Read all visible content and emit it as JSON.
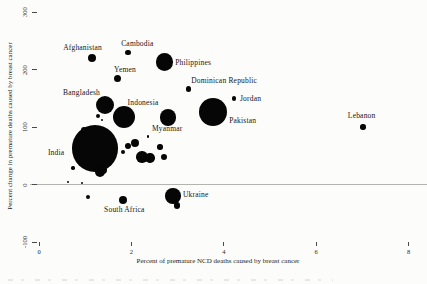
{
  "figure": {
    "background": "#fcfcfa",
    "bubble_color": "#060606",
    "text_color": "#1a1a1a",
    "zero_line_color": "#b5b3ae"
  },
  "chart_data": {
    "type": "scatter",
    "title": "",
    "xlabel": "Percent of premature NCD deaths caused by breast cancer",
    "ylabel": "Percent change in premature deaths caused by breast cancer",
    "xlim": [
      0,
      8.4
    ],
    "ylim": [
      -130,
      310
    ],
    "x_ticks": [
      0,
      2,
      4,
      6,
      8
    ],
    "y_ticks": [
      300,
      200,
      100,
      0,
      -100
    ],
    "grid": false,
    "zero_reference_line": true,
    "legend": "none",
    "series": [
      {
        "name": "countries",
        "points": [
          {
            "name": "Afghanistan",
            "x": 1.15,
            "y": 220,
            "r": 4.0,
            "label_offset": [
              -29,
              -14
            ]
          },
          {
            "name": "Cambodia",
            "x": 1.93,
            "y": 230,
            "r": 2.7,
            "label_offset": [
              -7,
              -12
            ]
          },
          {
            "name": "Philippines",
            "x": 2.71,
            "y": 213,
            "r": 8.7,
            "label_offset": [
              11,
              -3
            ]
          },
          {
            "name": "Yemen",
            "x": 1.69,
            "y": 185,
            "r": 3.5,
            "label_offset": [
              -3,
              -12
            ]
          },
          {
            "name": "Dominican Republic",
            "x": 3.23,
            "y": 166,
            "r": 2.7,
            "label_offset": [
              3,
              -12
            ]
          },
          {
            "name": "Bangladesh",
            "x": 1.43,
            "y": 138,
            "r": 9.3,
            "label_offset": [
              -42,
              -16
            ]
          },
          {
            "name": "Indonesia",
            "x": 1.83,
            "y": 117,
            "r": 11.0,
            "label_offset": [
              4,
              -18
            ]
          },
          {
            "name": "Myanmar",
            "x": 2.79,
            "y": 117,
            "r": 8.3,
            "label_offset": [
              -16,
              8
            ]
          },
          {
            "name": "Jordan",
            "x": 4.22,
            "y": 150,
            "r": 2.3,
            "label_offset": [
              6,
              -3
            ]
          },
          {
            "name": "Pakistan",
            "x": 3.77,
            "y": 126,
            "r": 14.0,
            "label_offset": [
              16,
              5
            ]
          },
          {
            "name": "Lebanon",
            "x": 7.01,
            "y": 100,
            "r": 2.7,
            "label_offset": [
              -15,
              -15
            ]
          },
          {
            "name": "India",
            "x": 1.21,
            "y": 63,
            "r": 23.3,
            "label_offset": [
              -47,
              1
            ]
          },
          {
            "name": "South Africa",
            "x": 1.82,
            "y": -27,
            "r": 4.3,
            "label_offset": [
              -19,
              6
            ]
          },
          {
            "name": "Ukraine",
            "x": 2.9,
            "y": -20,
            "r": 7.7,
            "label_offset": [
              10,
              -5
            ]
          }
        ]
      }
    ],
    "unlabeled_points": [
      {
        "x": 1.28,
        "y": 119,
        "r": 2.3
      },
      {
        "x": 1.36,
        "y": 112,
        "r": 1.3
      },
      {
        "x": 0.97,
        "y": 95,
        "r": 3.0
      },
      {
        "x": 2.36,
        "y": 83,
        "r": 1.3
      },
      {
        "x": 2.08,
        "y": 72,
        "r": 4.0
      },
      {
        "x": 1.93,
        "y": 67,
        "r": 3.3
      },
      {
        "x": 2.62,
        "y": 65,
        "r": 2.7
      },
      {
        "x": 1.82,
        "y": 57,
        "r": 2.0
      },
      {
        "x": 2.23,
        "y": 48,
        "r": 5.7
      },
      {
        "x": 2.4,
        "y": 46,
        "r": 4.7
      },
      {
        "x": 2.71,
        "y": 48,
        "r": 3.0
      },
      {
        "x": 0.74,
        "y": 29,
        "r": 1.7
      },
      {
        "x": 1.39,
        "y": 25,
        "r": 4.0
      },
      {
        "x": 1.32,
        "y": 22,
        "r": 5.0
      },
      {
        "x": 0.63,
        "y": 4,
        "r": 1.0
      },
      {
        "x": 0.93,
        "y": 3,
        "r": 1.2
      },
      {
        "x": 1.06,
        "y": -22,
        "r": 2.0
      },
      {
        "x": 2.99,
        "y": -37,
        "r": 3.3
      }
    ]
  }
}
